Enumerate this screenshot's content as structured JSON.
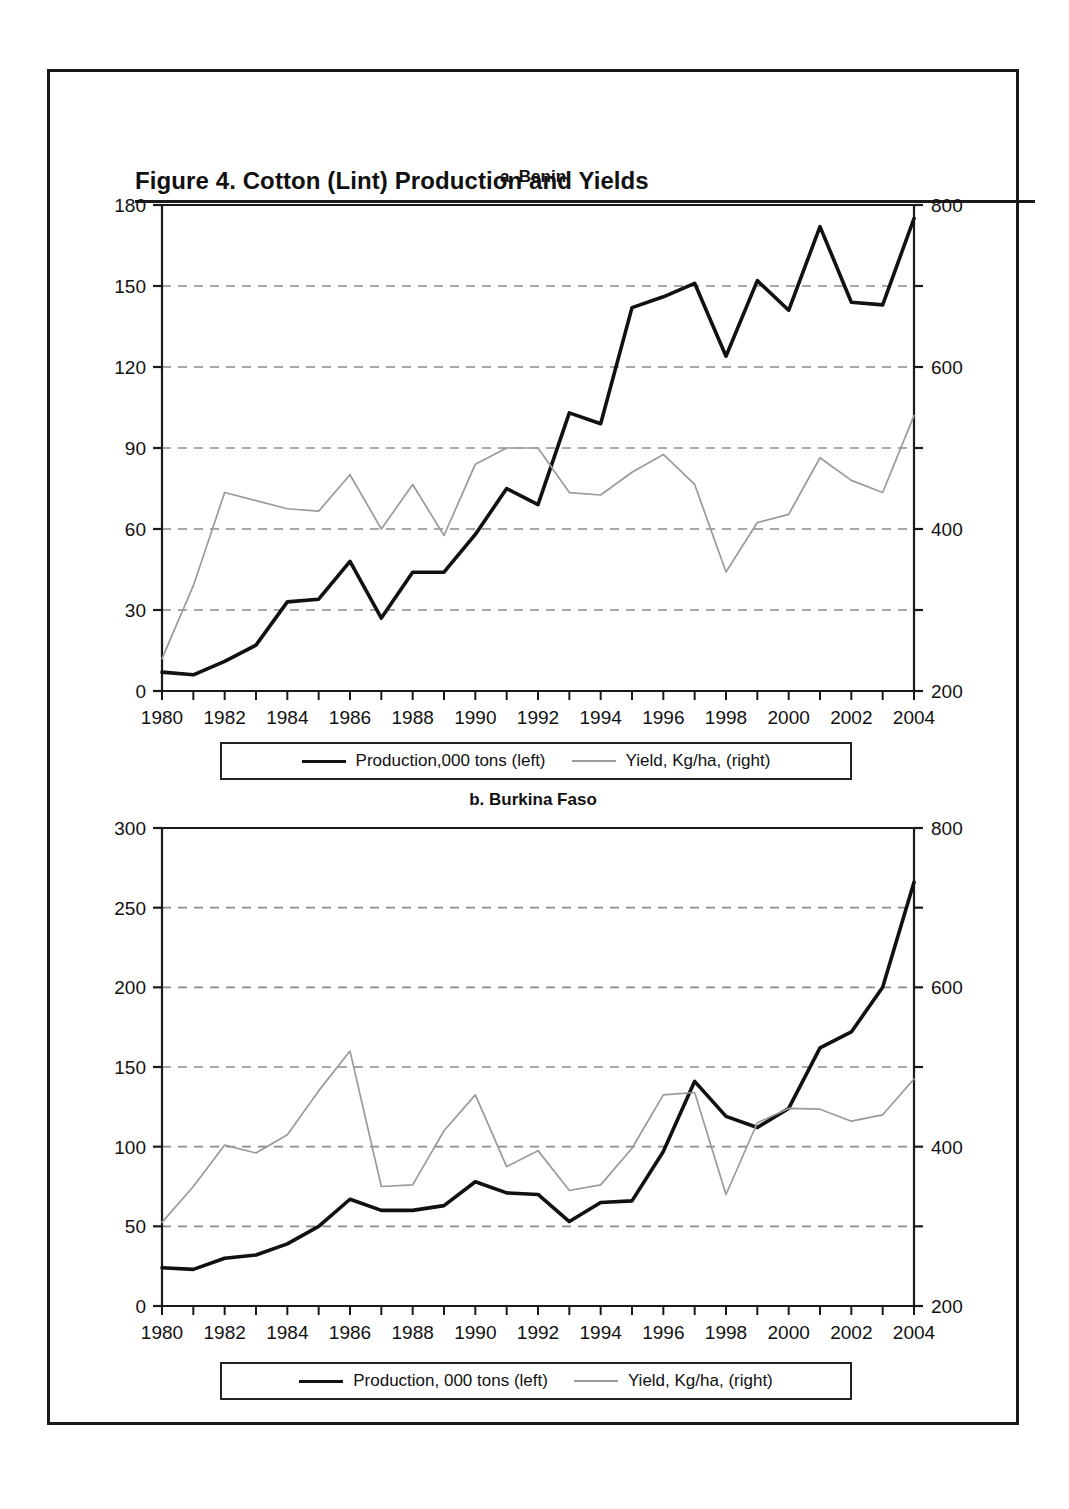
{
  "figure": {
    "title": "Figure 4.  Cotton (Lint) Production and Yields"
  },
  "panels": [
    {
      "id": "benin",
      "title": "a. Benin",
      "legend": {
        "production_label": "Production,000 tons (left)",
        "yield_label": "Yield, Kg/ha, (right)"
      }
    },
    {
      "id": "burkina-faso",
      "title": "b. Burkina Faso",
      "legend": {
        "production_label": "Production, 000 tons (left)",
        "yield_label": "Yield, Kg/ha, (right)"
      }
    }
  ],
  "colors": {
    "production_line": "#111111",
    "yield_line": "#9a9a9a",
    "gridline": "#8c8c8c",
    "axis": "#1a1a1a",
    "frame": "#1a1a1a"
  },
  "chart_data": [
    {
      "type": "line",
      "id": "benin",
      "title": "a. Benin",
      "xlabel": "",
      "ylabel": "",
      "grid": true,
      "legend_position": "bottom",
      "x": [
        1980,
        1981,
        1982,
        1983,
        1984,
        1985,
        1986,
        1987,
        1988,
        1989,
        1990,
        1991,
        1992,
        1993,
        1994,
        1995,
        1996,
        1997,
        1998,
        1999,
        2000,
        2001,
        2002,
        2003,
        2004
      ],
      "xticklabels": [
        "1980",
        "1982",
        "1984",
        "1986",
        "1988",
        "1990",
        "1992",
        "1994",
        "1996",
        "1998",
        "2000",
        "2002",
        "2004"
      ],
      "xlim": [
        1980,
        2004
      ],
      "left_axis": {
        "label": "Production, 000 tons",
        "ylim": [
          0,
          180
        ],
        "yticks": [
          0,
          30,
          60,
          90,
          120,
          150,
          180
        ]
      },
      "right_axis": {
        "label": "Yield, Kg/ha",
        "ylim": [
          200,
          800
        ],
        "yticks": [
          200,
          300,
          400,
          500,
          600,
          700,
          800
        ],
        "yticklabels_shown": [
          "200",
          "400",
          "600",
          "800"
        ]
      },
      "series": [
        {
          "name": "Production,000 tons (left)",
          "axis": "left",
          "style": "solid-thick",
          "color": "#111111",
          "values": [
            7,
            6,
            11,
            17,
            33,
            34,
            48,
            27,
            44,
            44,
            58,
            75,
            69,
            103,
            99,
            142,
            146,
            151,
            124,
            152,
            141,
            172,
            144,
            143,
            175
          ]
        },
        {
          "name": "Yield, Kg/ha, (right)",
          "axis": "right",
          "style": "solid-thin",
          "color": "#9a9a9a",
          "values": [
            240,
            330,
            445,
            435,
            425,
            422,
            467,
            400,
            455,
            392,
            480,
            500,
            500,
            445,
            442,
            470,
            492,
            455,
            347,
            408,
            418,
            488,
            460,
            445,
            540
          ]
        }
      ]
    },
    {
      "type": "line",
      "id": "burkina-faso",
      "title": "b. Burkina Faso",
      "xlabel": "",
      "ylabel": "",
      "grid": true,
      "legend_position": "bottom",
      "x": [
        1980,
        1981,
        1982,
        1983,
        1984,
        1985,
        1986,
        1987,
        1988,
        1989,
        1990,
        1991,
        1992,
        1993,
        1994,
        1995,
        1996,
        1997,
        1998,
        1999,
        2000,
        2001,
        2002,
        2003,
        2004
      ],
      "xticklabels": [
        "1980",
        "1982",
        "1984",
        "1986",
        "1988",
        "1990",
        "1992",
        "1994",
        "1996",
        "1998",
        "2000",
        "2002",
        "2004"
      ],
      "xlim": [
        1980,
        2004
      ],
      "left_axis": {
        "label": "Production, 000 tons",
        "ylim": [
          0,
          300
        ],
        "yticks": [
          0,
          50,
          100,
          150,
          200,
          250,
          300
        ]
      },
      "right_axis": {
        "label": "Yield, Kg/ha",
        "ylim": [
          200,
          800
        ],
        "yticks": [
          200,
          300,
          400,
          500,
          600,
          700,
          800
        ],
        "yticklabels_shown": [
          "200",
          "400",
          "600",
          "800"
        ]
      },
      "series": [
        {
          "name": "Production, 000 tons (left)",
          "axis": "left",
          "style": "solid-thick",
          "color": "#111111",
          "values": [
            24,
            23,
            30,
            32,
            39,
            50,
            67,
            60,
            60,
            63,
            78,
            71,
            70,
            53,
            65,
            66,
            97,
            141,
            119,
            112,
            124,
            162,
            172,
            200,
            266
          ]
        },
        {
          "name": "Yield, Kg/ha, (right)",
          "axis": "right",
          "style": "solid-thin",
          "color": "#9a9a9a",
          "values": [
            305,
            350,
            402,
            392,
            415,
            470,
            520,
            350,
            352,
            420,
            465,
            375,
            395,
            345,
            352,
            398,
            465,
            468,
            340,
            430,
            448,
            447,
            432,
            440,
            485
          ]
        }
      ]
    }
  ]
}
